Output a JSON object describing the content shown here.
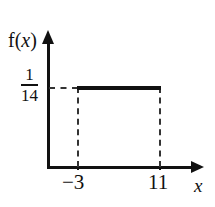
{
  "chart_data": {
    "type": "area",
    "title": "",
    "subtitle": "",
    "xlabel": "x",
    "ylabel": "f(x)",
    "xlim": [
      -3,
      11
    ],
    "ylim": [
      0,
      0.0714285714
    ],
    "grid": false,
    "legend": null,
    "x_tick_labels": [
      "−3",
      "11"
    ],
    "x_tick_values": [
      -3,
      11
    ],
    "y_tick_labels": [
      "1/14"
    ],
    "y_tick_values": [
      0.0714285714
    ],
    "series": [
      {
        "name": "f(x)",
        "x": [
          -3,
          11
        ],
        "values": [
          0.0714285714,
          0.0714285714
        ],
        "style": "solid-segment"
      }
    ],
    "annotations": [
      {
        "name": "guide-horizontal",
        "style": "dashed",
        "from": [
          0,
          0.0714285714
        ],
        "to": [
          -3,
          0.0714285714
        ]
      },
      {
        "name": "guide-left",
        "style": "dashed",
        "from": [
          -3,
          0
        ],
        "to": [
          -3,
          0.0714285714
        ]
      },
      {
        "name": "guide-right",
        "style": "dashed",
        "from": [
          11,
          0
        ],
        "to": [
          11,
          0.0714285714
        ]
      }
    ]
  },
  "axes": {
    "y_label_prefix": "f(",
    "y_label_var": "x",
    "y_label_suffix": ")",
    "x_label": "x",
    "y_value_numerator": "1",
    "y_value_denominator": "14",
    "tick_label_left": "−3",
    "tick_label_right": "11"
  },
  "colors": {
    "ink": "#111111",
    "dashed": "#333333",
    "background": "#ffffff"
  }
}
